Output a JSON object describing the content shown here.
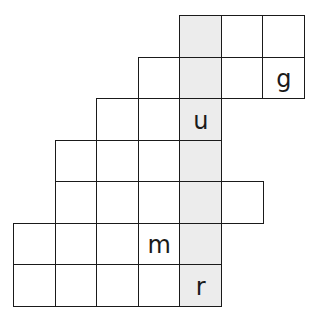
{
  "puzzle": {
    "type": "crossword-grid",
    "cell_size_px": 41.5,
    "origin": {
      "x": 14,
      "y": 16
    },
    "colors": {
      "shaded": "#ececec",
      "line": "#1a1a1a",
      "cell": "#ffffff"
    },
    "shaded_column": 4,
    "rows": [
      {
        "row": 0,
        "cells": [
          {
            "col": 4,
            "letter": "",
            "shaded": true
          },
          {
            "col": 5,
            "letter": ""
          },
          {
            "col": 6,
            "letter": ""
          }
        ]
      },
      {
        "row": 1,
        "cells": [
          {
            "col": 3,
            "letter": ""
          },
          {
            "col": 4,
            "letter": "",
            "shaded": true
          },
          {
            "col": 5,
            "letter": ""
          },
          {
            "col": 6,
            "letter": "g"
          }
        ]
      },
      {
        "row": 2,
        "cells": [
          {
            "col": 2,
            "letter": ""
          },
          {
            "col": 3,
            "letter": ""
          },
          {
            "col": 4,
            "letter": "u",
            "shaded": true
          }
        ]
      },
      {
        "row": 3,
        "cells": [
          {
            "col": 1,
            "letter": ""
          },
          {
            "col": 2,
            "letter": ""
          },
          {
            "col": 3,
            "letter": ""
          },
          {
            "col": 4,
            "letter": "",
            "shaded": true
          }
        ]
      },
      {
        "row": 4,
        "cells": [
          {
            "col": 1,
            "letter": ""
          },
          {
            "col": 2,
            "letter": ""
          },
          {
            "col": 3,
            "letter": ""
          },
          {
            "col": 4,
            "letter": "",
            "shaded": true
          },
          {
            "col": 5,
            "letter": ""
          }
        ]
      },
      {
        "row": 5,
        "cells": [
          {
            "col": 0,
            "letter": ""
          },
          {
            "col": 1,
            "letter": ""
          },
          {
            "col": 2,
            "letter": ""
          },
          {
            "col": 3,
            "letter": "m"
          },
          {
            "col": 4,
            "letter": "",
            "shaded": true
          }
        ]
      },
      {
        "row": 6,
        "cells": [
          {
            "col": 0,
            "letter": ""
          },
          {
            "col": 1,
            "letter": ""
          },
          {
            "col": 2,
            "letter": ""
          },
          {
            "col": 3,
            "letter": ""
          },
          {
            "col": 4,
            "letter": "r",
            "shaded": true
          }
        ]
      }
    ]
  }
}
